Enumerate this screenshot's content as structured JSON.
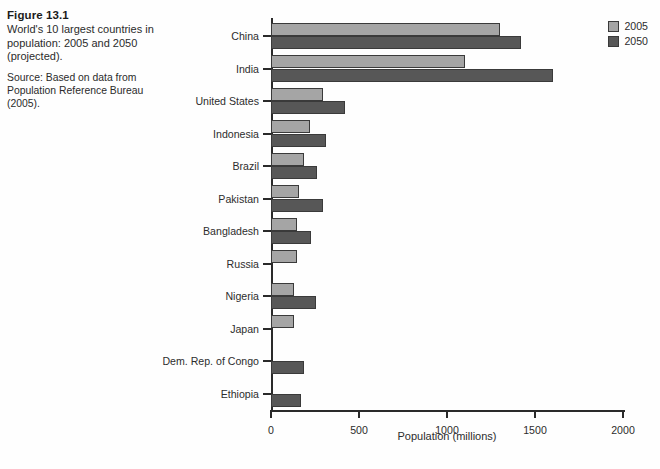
{
  "caption": {
    "figure_number": "Figure 13.1",
    "description": "World's 10 largest countries in population: 2005 and 2050 (projected).",
    "source": "Source: Based on data from Population Reference Bureau (2005)."
  },
  "legend": {
    "position": "top-right",
    "entries": [
      {
        "label": "2005",
        "color": "#a5a5a5"
      },
      {
        "label": "2050",
        "color": "#575757"
      }
    ]
  },
  "chart_data": {
    "type": "bar",
    "orientation": "horizontal",
    "title": "World's 10 largest countries in population: 2005 and 2050 (projected).",
    "xlabel": "Population (millions)",
    "ylabel": "",
    "xlim": [
      0,
      2000
    ],
    "xticks": [
      0,
      500,
      1000,
      1500,
      2000
    ],
    "xtick_labels": [
      "0",
      "500",
      "1000",
      "1500",
      "2000"
    ],
    "grid": false,
    "legend_position": "top-right",
    "categories": [
      "China",
      "India",
      "United States",
      "Indonesia",
      "Brazil",
      "Pakistan",
      "Bangladesh",
      "Russia",
      "Nigeria",
      "Japan",
      "Dem. Rep. of Congo",
      "Ethiopia"
    ],
    "series": [
      {
        "name": "2005",
        "color": "#a5a5a5",
        "values": [
          1300,
          1100,
          295,
          220,
          185,
          160,
          145,
          145,
          130,
          128,
          null,
          null
        ]
      },
      {
        "name": "2050",
        "color": "#575757",
        "values": [
          1420,
          1600,
          420,
          310,
          260,
          295,
          230,
          null,
          255,
          null,
          185,
          170
        ]
      }
    ]
  }
}
